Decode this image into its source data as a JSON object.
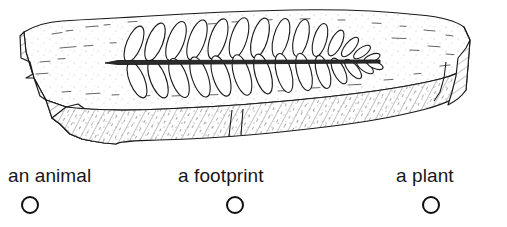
{
  "illustration": {
    "name": "fossil-rock-slab-with-fern-imprint",
    "description": "Line drawing of a stone slab containing the fossilized imprint of a fern frond",
    "stroke_color": "#1a1a1a",
    "fill_color": "#ffffff",
    "elements": {
      "rock_slab": "rock-slab",
      "fossil": "fern-frond-fossil",
      "leaflet_count": 28,
      "rachis": "central-stem"
    }
  },
  "options": [
    {
      "id": "animal",
      "label": "an animal",
      "selected": false
    },
    {
      "id": "footprint",
      "label": "a footprint",
      "selected": false
    },
    {
      "id": "plant",
      "label": "a plant",
      "selected": false
    }
  ]
}
